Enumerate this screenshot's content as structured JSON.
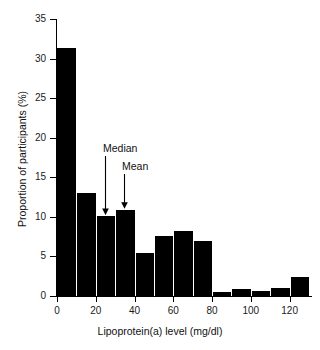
{
  "chart_data": {
    "type": "bar",
    "title": "",
    "subtitle": "",
    "xlabel": "Lipoprotein(a) level (mg/dl)",
    "ylabel": "Proportion of participants (%)",
    "xlim": [
      0,
      130
    ],
    "ylim": [
      0,
      35
    ],
    "grid": false,
    "legend": null,
    "bin_width": 10,
    "categories": [
      "0-10",
      "10-20",
      "20-30",
      "30-40",
      "40-50",
      "50-60",
      "60-70",
      "70-80",
      "80-90",
      "90-100",
      "100-110",
      "110-120",
      "120-130"
    ],
    "bin_starts": [
      0,
      10,
      20,
      30,
      40,
      50,
      60,
      70,
      80,
      90,
      100,
      110,
      120
    ],
    "values": [
      31.3,
      13.0,
      10.1,
      10.9,
      5.4,
      7.6,
      8.2,
      7.0,
      0.5,
      0.9,
      0.6,
      1.0,
      2.4
    ],
    "xticks": [
      0,
      20,
      40,
      60,
      80,
      100,
      120
    ],
    "xtick_labels": [
      "0",
      "20",
      "40",
      "60",
      "80",
      "100",
      "120"
    ],
    "yticks": [
      0,
      5,
      10,
      15,
      20,
      25,
      30,
      35
    ],
    "ytick_labels": [
      "0",
      "5",
      "10",
      "15",
      "20",
      "25",
      "30",
      "35"
    ],
    "annotations": [
      {
        "label": "Median",
        "x_value": 25,
        "target_y": 10.1
      },
      {
        "label": "Mean",
        "x_value": 35,
        "target_y": 10.9
      }
    ],
    "colors": {
      "bar": "#000000",
      "axis": "#000000",
      "text": "#111111",
      "background": "#ffffff",
      "bar_separator": "#ffffff"
    }
  }
}
